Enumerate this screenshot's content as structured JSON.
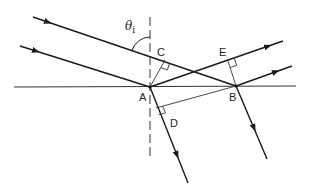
{
  "diagram": {
    "type": "reflection-refraction-geometry",
    "colors": {
      "line": "#1a1a1a",
      "thin_line": "#333333",
      "background": "#ffffff"
    },
    "labels": {
      "theta": "θ",
      "theta_sub": "i",
      "A": "A",
      "B": "B",
      "C": "C",
      "D": "D",
      "E": "E"
    },
    "points": {
      "A": [
        150,
        87
      ],
      "B": [
        236,
        86
      ],
      "C": [
        165,
        60
      ],
      "D": [
        156,
        108
      ],
      "E": [
        228,
        61
      ]
    }
  }
}
